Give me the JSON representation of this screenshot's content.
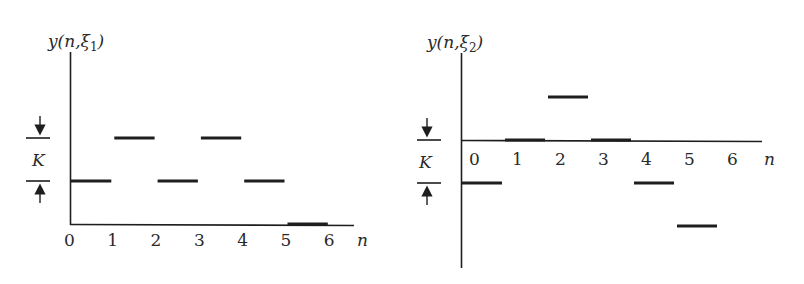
{
  "chart_data": [
    {
      "type": "line",
      "subtype": "step",
      "title": "",
      "ylabel": "y(n,ξ1)",
      "ylabel_parts": {
        "main": "y(n,ξ",
        "sub": "1",
        "close": ")"
      },
      "xlabel": "n",
      "x_ticks": [
        "0",
        "1",
        "2",
        "3",
        "4",
        "5",
        "6"
      ],
      "step_height_label": "K",
      "units": "K",
      "segments": [
        {
          "n_start": 0,
          "n_end": 1,
          "value": 1
        },
        {
          "n_start": 1,
          "n_end": 2,
          "value": 2
        },
        {
          "n_start": 2,
          "n_end": 3,
          "value": 1
        },
        {
          "n_start": 3,
          "n_end": 4,
          "value": 2
        },
        {
          "n_start": 4,
          "n_end": 5,
          "value": 1
        },
        {
          "n_start": 5,
          "n_end": 6,
          "value": 0
        }
      ],
      "x": [
        0,
        1,
        2,
        3,
        4,
        5
      ],
      "values": [
        1,
        2,
        1,
        2,
        1,
        0
      ],
      "ylim": [
        0,
        2
      ],
      "grid": false,
      "legend": "none"
    },
    {
      "type": "line",
      "subtype": "step",
      "title": "",
      "ylabel": "y(n,ξ2)",
      "ylabel_parts": {
        "main": "y(n,ξ",
        "sub": "2",
        "close": ")"
      },
      "xlabel": "n",
      "x_ticks": [
        "0",
        "1",
        "2",
        "3",
        "4",
        "5",
        "6"
      ],
      "step_height_label": "K",
      "units": "K",
      "segments": [
        {
          "n_start": 0,
          "n_end": 1,
          "value": -1
        },
        {
          "n_start": 1,
          "n_end": 2,
          "value": 0
        },
        {
          "n_start": 2,
          "n_end": 3,
          "value": 1
        },
        {
          "n_start": 3,
          "n_end": 4,
          "value": 0
        },
        {
          "n_start": 4,
          "n_end": 5,
          "value": -1
        },
        {
          "n_start": 5,
          "n_end": 6,
          "value": -2
        }
      ],
      "x": [
        0,
        1,
        2,
        3,
        4,
        5
      ],
      "values": [
        -1,
        0,
        1,
        0,
        -1,
        -2
      ],
      "ylim": [
        -2,
        1
      ],
      "grid": false,
      "legend": "none"
    }
  ],
  "colors": {
    "ink": "#1e1e1e",
    "text": "#2a2a2a",
    "background": "#ffffff"
  }
}
